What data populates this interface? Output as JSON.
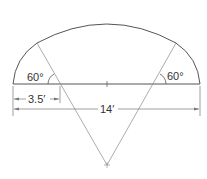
{
  "diagram": {
    "type": "segmental arch geometry",
    "labels": {
      "left_angle": "60°",
      "right_angle": "60°",
      "short_dimension": "3.5′",
      "span_dimension": "14′"
    },
    "colors": {
      "outline": "#555555",
      "construction": "#888888",
      "text": "#333333"
    }
  }
}
